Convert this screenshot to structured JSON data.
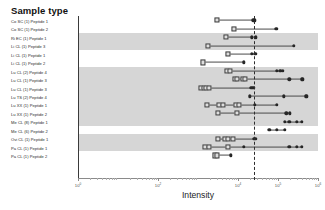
{
  "legend": {
    "title": "Sample type",
    "items": [
      "Co SC (1) Peptide 1",
      "Co SC (1) Peptide 2",
      "Ri EC (1) Peptide 1",
      "Li CL (1) Peptide 3",
      "Li CL (1) Peptide 1",
      "Li CL (1) Peptide 2",
      "Lu CL (2) Peptide 4",
      "Lu CL (1) Peptide 3",
      "Lu CL (1) Peptide 3",
      "Lu TS (2) Peptide 4",
      "Lu XX (1) Peptide 1",
      "Lu XX (1) Peptide 2",
      "Me CL (8) Peptide 1",
      "Me CL (6) Peptide 2",
      "Ovi CL (1) Peptide 1",
      "Pa CL (1) Peptide 1",
      "Pa CL (1) Peptide 2"
    ]
  },
  "axis": {
    "x_title": "Intensity",
    "tick_labels": [
      "10",
      "10",
      "10",
      "10",
      "10"
    ],
    "tick_exponents": [
      "0",
      "2",
      "4",
      "5",
      "6"
    ]
  },
  "chart_data": {
    "type": "scatter",
    "title": "",
    "xlabel": "Intensity",
    "ylabel": "",
    "xscale": "log",
    "xlim": [
      1,
      1000000
    ],
    "grid": false,
    "legend_position": "left-outside",
    "reference_line_x": 25000,
    "marker_types": {
      "open": "open-square",
      "filled": "filled-circle"
    },
    "band_shading": "alternating-gray-groups",
    "categories": [
      "Co SC (1) Peptide 1",
      "Co SC (1) Peptide 2",
      "Ri EC (1) Peptide 1",
      "Li CL (1) Peptide 3",
      "Li CL (1) Peptide 1",
      "Li CL (1) Peptide 2",
      "Lu CL (2) Peptide 4",
      "Lu CL (1) Peptide 3",
      "Lu CL (1) Peptide 3",
      "Lu TS (2) Peptide 4",
      "Lu XX (1) Peptide 1",
      "Lu XX (1) Peptide 2",
      "Me CL (8) Peptide 1",
      "Me CL (6) Peptide 2",
      "Ovi CL (1) Peptide 1",
      "Pa CL (1) Peptide 1",
      "Pa CL (1) Peptide 2"
    ],
    "series": [
      {
        "name": "Co SC (1) Peptide 1",
        "range": [
          3000,
          26000
        ],
        "points": [
          {
            "x": 3000,
            "type": "open"
          },
          {
            "x": 24000,
            "type": "filled"
          },
          {
            "x": 26000,
            "type": "filled"
          }
        ]
      },
      {
        "name": "Co SC (1) Peptide 2",
        "range": [
          8000,
          90000
        ],
        "points": [
          {
            "x": 8000,
            "type": "open"
          },
          {
            "x": 90000,
            "type": "filled"
          }
        ]
      },
      {
        "name": "Ri EC (1) Peptide 1",
        "range": [
          5000,
          28000
        ],
        "points": [
          {
            "x": 5000,
            "type": "open"
          },
          {
            "x": 22000,
            "type": "filled"
          },
          {
            "x": 28000,
            "type": "filled"
          }
        ]
      },
      {
        "name": "Li CL (1) Peptide 3",
        "range": [
          1800,
          250000
        ],
        "points": [
          {
            "x": 1800,
            "type": "open"
          },
          {
            "x": 250000,
            "type": "filled"
          }
        ]
      },
      {
        "name": "Li CL (1) Peptide 1",
        "range": [
          5500,
          27000
        ],
        "points": [
          {
            "x": 5500,
            "type": "open"
          },
          {
            "x": 22000,
            "type": "filled"
          },
          {
            "x": 27000,
            "type": "filled"
          }
        ]
      },
      {
        "name": "Li CL (1) Peptide 2",
        "range": [
          1300,
          14000
        ],
        "points": [
          {
            "x": 1300,
            "type": "open"
          },
          {
            "x": 14000,
            "type": "filled"
          }
        ]
      },
      {
        "name": "Lu CL (2) Peptide 4",
        "range": [
          5200,
          130000
        ],
        "points": [
          {
            "x": 5200,
            "type": "open"
          },
          {
            "x": 6200,
            "type": "open"
          },
          {
            "x": 95000,
            "type": "filled"
          },
          {
            "x": 115000,
            "type": "filled"
          },
          {
            "x": 130000,
            "type": "filled"
          }
        ]
      },
      {
        "name": "Lu CL (1) Peptide 3",
        "range": [
          8500,
          420000
        ],
        "points": [
          {
            "x": 8500,
            "type": "open"
          },
          {
            "x": 9500,
            "type": "open"
          },
          {
            "x": 13000,
            "type": "open"
          },
          {
            "x": 15000,
            "type": "open"
          },
          {
            "x": 190000,
            "type": "filled"
          },
          {
            "x": 400000,
            "type": "filled"
          },
          {
            "x": 420000,
            "type": "filled"
          }
        ]
      },
      {
        "name": "Lu CL (1) Peptide 3",
        "range": [
          1200,
          25000
        ],
        "points": [
          {
            "x": 1200,
            "type": "open"
          },
          {
            "x": 1400,
            "type": "open"
          },
          {
            "x": 1600,
            "type": "open"
          },
          {
            "x": 1900,
            "type": "open"
          },
          {
            "x": 21000,
            "type": "filled"
          },
          {
            "x": 23000,
            "type": "filled"
          },
          {
            "x": 25000,
            "type": "filled"
          }
        ]
      },
      {
        "name": "Lu TS (2) Peptide 4",
        "range": [
          20000,
          520000
        ],
        "points": [
          {
            "x": 20000,
            "type": "filled"
          },
          {
            "x": 140000,
            "type": "filled"
          },
          {
            "x": 500000,
            "type": "filled"
          },
          {
            "x": 520000,
            "type": "filled"
          }
        ]
      },
      {
        "name": "Lu XX (1) Peptide 1",
        "range": [
          1700,
          95000
        ],
        "points": [
          {
            "x": 1700,
            "type": "open"
          },
          {
            "x": 3400,
            "type": "open"
          },
          {
            "x": 4300,
            "type": "open"
          },
          {
            "x": 9000,
            "type": "open"
          },
          {
            "x": 10500,
            "type": "open"
          },
          {
            "x": 26000,
            "type": "filled"
          },
          {
            "x": 95000,
            "type": "filled"
          }
        ]
      },
      {
        "name": "Lu XX (1) Peptide 2",
        "range": [
          3200,
          200000
        ],
        "points": [
          {
            "x": 3200,
            "type": "open"
          },
          {
            "x": 9500,
            "type": "open"
          },
          {
            "x": 160000,
            "type": "filled"
          },
          {
            "x": 200000,
            "type": "filled"
          }
        ]
      },
      {
        "name": "Me CL (8) Peptide 1",
        "range": [
          150000,
          400000
        ],
        "points": [
          {
            "x": 150000,
            "type": "filled"
          },
          {
            "x": 190000,
            "type": "filled"
          },
          {
            "x": 300000,
            "type": "filled"
          },
          {
            "x": 400000,
            "type": "filled"
          }
        ]
      },
      {
        "name": "Me CL (6) Peptide 2",
        "range": [
          60000,
          150000
        ],
        "points": [
          {
            "x": 60000,
            "type": "filled"
          },
          {
            "x": 95000,
            "type": "filled"
          },
          {
            "x": 150000,
            "type": "filled"
          }
        ]
      },
      {
        "name": "Ovi CL (1) Peptide 1",
        "range": [
          3100,
          27000
        ],
        "points": [
          {
            "x": 3100,
            "type": "open"
          },
          {
            "x": 4600,
            "type": "open"
          },
          {
            "x": 5600,
            "type": "open"
          },
          {
            "x": 7600,
            "type": "open"
          },
          {
            "x": 25000,
            "type": "filled"
          },
          {
            "x": 27000,
            "type": "filled"
          }
        ]
      },
      {
        "name": "Pa CL (1) Peptide 1",
        "range": [
          1500,
          400000
        ],
        "points": [
          {
            "x": 1500,
            "type": "open"
          },
          {
            "x": 1900,
            "type": "open"
          },
          {
            "x": 5600,
            "type": "open"
          },
          {
            "x": 14000,
            "type": "filled"
          },
          {
            "x": 190000,
            "type": "filled"
          },
          {
            "x": 300000,
            "type": "filled"
          },
          {
            "x": 400000,
            "type": "filled"
          }
        ]
      },
      {
        "name": "Pa CL (1) Peptide 2",
        "range": [
          2600,
          6500
        ],
        "points": [
          {
            "x": 2600,
            "type": "open"
          },
          {
            "x": 3000,
            "type": "open"
          },
          {
            "x": 6500,
            "type": "filled"
          }
        ]
      }
    ]
  }
}
